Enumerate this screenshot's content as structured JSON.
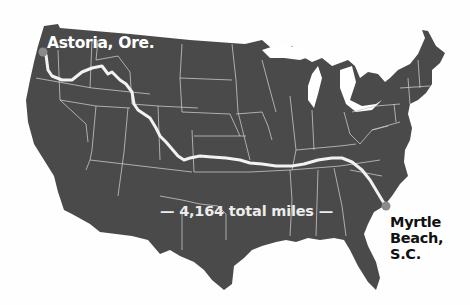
{
  "map": {
    "region": "Contiguous United States",
    "land_color": "#4a4a4a",
    "border_color": "#c8c8c8",
    "route_color": "#f2f2f2",
    "marker_color": "#8a8a8a",
    "background_color": "#ffffff"
  },
  "route": {
    "start_label": "Astoria, Ore.",
    "end_label_lines": [
      "Myrtle",
      "Beach,",
      "S.C."
    ],
    "distance_label": "— 4,164 total miles —"
  }
}
